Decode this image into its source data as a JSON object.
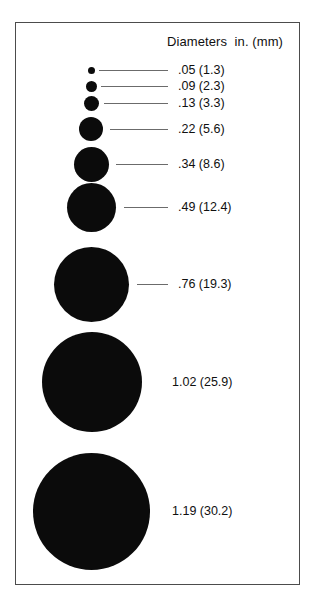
{
  "figure": {
    "header": "Diameters  in. (mm)",
    "background_color": "#ffffff",
    "frame_color": "#4c4c4c",
    "dot_color": "#0b0b0b",
    "leader_color": "#6b6b6b"
  },
  "chart_data": {
    "type": "scatter",
    "title": "Diameters  in. (mm)",
    "xlabel": "",
    "ylabel": "",
    "legend_position": "right",
    "grid": false,
    "units": {
      "primary": "in.",
      "secondary": "mm"
    },
    "categories": [
      ".05 (1.3)",
      ".09 (2.3)",
      ".13 (3.3)",
      ".22 (5.6)",
      ".34 (8.6)",
      ".49 (12.4)",
      ".76 (19.3)",
      "1.02 (25.9)",
      "1.19 (30.2)"
    ],
    "values_in": [
      0.05,
      0.09,
      0.13,
      0.22,
      0.34,
      0.49,
      0.76,
      1.02,
      1.19
    ],
    "values_mm": [
      1.3,
      2.3,
      3.3,
      5.6,
      8.6,
      12.4,
      19.3,
      25.9,
      30.2
    ],
    "series": [
      {
        "name": "Diameter",
        "values": [
          1.3,
          2.3,
          3.3,
          5.6,
          8.6,
          12.4,
          19.3,
          25.9,
          30.2
        ]
      }
    ]
  },
  "rows": [
    {
      "label": ".05 (1.3)",
      "diameter_in": 0.05,
      "diameter_mm": 1.3,
      "dot_px": 7,
      "dot_cx": 91,
      "dot_cy": 70,
      "leader_x1": 99,
      "leader_x2": 168,
      "leader_y": 70,
      "label_x": 178,
      "label_y": 63
    },
    {
      "label": ".09 (2.3)",
      "diameter_in": 0.09,
      "diameter_mm": 2.3,
      "dot_px": 11,
      "dot_cx": 91,
      "dot_cy": 86,
      "leader_x1": 101,
      "leader_x2": 168,
      "leader_y": 86,
      "label_x": 178,
      "label_y": 79
    },
    {
      "label": ".13 (3.3)",
      "diameter_in": 0.13,
      "diameter_mm": 3.3,
      "dot_px": 15,
      "dot_cx": 91,
      "dot_cy": 103,
      "leader_x1": 104,
      "leader_x2": 168,
      "leader_y": 103,
      "label_x": 178,
      "label_y": 96
    },
    {
      "label": ".22 (5.6)",
      "diameter_in": 0.22,
      "diameter_mm": 5.6,
      "dot_px": 24,
      "dot_cx": 91,
      "dot_cy": 129,
      "leader_x1": 110,
      "leader_x2": 168,
      "leader_y": 129,
      "label_x": 178,
      "label_y": 122
    },
    {
      "label": ".34 (8.6)",
      "diameter_in": 0.34,
      "diameter_mm": 8.6,
      "dot_px": 35,
      "dot_cx": 91,
      "dot_cy": 164,
      "leader_x1": 116,
      "leader_x2": 168,
      "leader_y": 164,
      "label_x": 178,
      "label_y": 157
    },
    {
      "label": ".49 (12.4)",
      "diameter_in": 0.49,
      "diameter_mm": 12.4,
      "dot_px": 49,
      "dot_cx": 91,
      "dot_cy": 207,
      "leader_x1": 124,
      "leader_x2": 168,
      "leader_y": 207,
      "label_x": 178,
      "label_y": 200
    },
    {
      "label": ".76 (19.3)",
      "diameter_in": 0.76,
      "diameter_mm": 19.3,
      "dot_px": 75,
      "dot_cx": 91,
      "dot_cy": 284,
      "leader_x1": 137,
      "leader_x2": 168,
      "leader_y": 284,
      "label_x": 178,
      "label_y": 277
    },
    {
      "label": "1.02 (25.9)",
      "diameter_in": 1.02,
      "diameter_mm": 25.9,
      "dot_px": 100,
      "dot_cx": 92,
      "dot_cy": 382,
      "leader_x1": 0,
      "leader_x2": 0,
      "leader_y": 382,
      "label_x": 172,
      "label_y": 375
    },
    {
      "label": "1.19 (30.2)",
      "diameter_in": 1.19,
      "diameter_mm": 30.2,
      "dot_px": 117,
      "dot_cx": 91,
      "dot_cy": 511,
      "leader_x1": 0,
      "leader_x2": 0,
      "leader_y": 511,
      "label_x": 172,
      "label_y": 504
    }
  ]
}
